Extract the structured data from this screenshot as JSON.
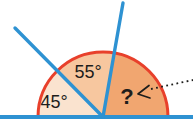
{
  "figure": {
    "labels": {
      "angle_left": "45°",
      "angle_middle": "55°",
      "angle_unknown": "?"
    },
    "values": {
      "angle_left_deg": 45,
      "angle_middle_deg": 55
    },
    "colors": {
      "sector_left": "#fae3cf",
      "sector_middle": "#f7c79f",
      "sector_unknown": "#f1a670",
      "arc_red": "#e8402b",
      "line_blue": "#2e92d2",
      "text_dark": "#1d1d1b"
    }
  }
}
